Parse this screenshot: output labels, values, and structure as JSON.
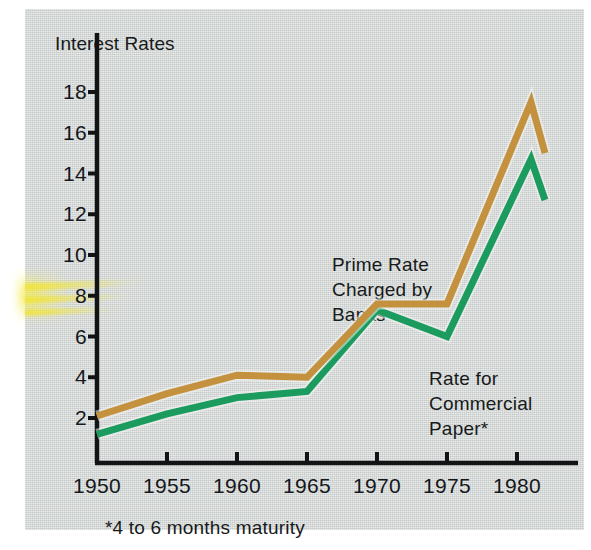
{
  "figure": {
    "background_color": "#d3d8d6",
    "axis_color": "#111314",
    "footnote": "*4 to 6 months maturity",
    "highlighter_color": "#f0e43c"
  },
  "chart_data": {
    "type": "line",
    "title": "Interest Rates",
    "ylabel": "Interest Rates",
    "xlabel": "",
    "xlim": [
      1950,
      1982
    ],
    "ylim": [
      0,
      19
    ],
    "grid": false,
    "legend_position": "inline-annotations",
    "ytick_labels": [
      "18",
      "16",
      "14",
      "12",
      "10",
      "8",
      "6",
      "4",
      "2"
    ],
    "ytick_values": [
      18,
      16,
      14,
      12,
      10,
      8,
      6,
      4,
      2
    ],
    "xtick_labels": [
      "1950",
      "1955",
      "1960",
      "1965",
      "1970",
      "1975",
      "1980"
    ],
    "xtick_values": [
      1950,
      1955,
      1960,
      1965,
      1970,
      1975,
      1980
    ],
    "x": [
      1950,
      1955,
      1960,
      1965,
      1970,
      1975,
      1981,
      1982
    ],
    "series": [
      {
        "name": "Prime Rate Charged by Banks",
        "color": "#c4913f",
        "annotation": "Prime Rate\nCharged by\nBanks",
        "values": [
          2.1,
          3.2,
          4.1,
          4.0,
          7.6,
          7.6,
          17.5,
          15.0
        ]
      },
      {
        "name": "Rate for Commercial Paper*",
        "color": "#1c9b5e",
        "annotation": "Rate for\nCommercial\nPaper*",
        "values": [
          1.2,
          2.2,
          3.0,
          3.3,
          7.3,
          6.0,
          14.7,
          12.7
        ]
      }
    ]
  }
}
